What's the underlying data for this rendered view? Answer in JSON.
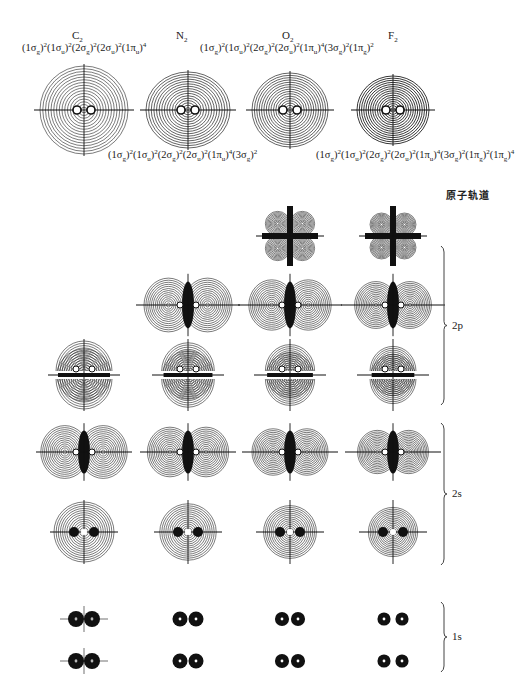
{
  "molecules": [
    {
      "name": "C",
      "sub": "2",
      "x": 72,
      "y": 34
    },
    {
      "name": "N",
      "sub": "2",
      "x": 176,
      "y": 34
    },
    {
      "name": "O",
      "sub": "2",
      "x": 282,
      "y": 34
    },
    {
      "name": "F",
      "sub": "2",
      "x": 388,
      "y": 34
    }
  ],
  "configurations": [
    {
      "molecule": "C2",
      "text": "(1σg)²(1σu)²(2σg)²(2σu)²(1πu)⁴",
      "terms": [
        [
          "1σ",
          "g",
          "2"
        ],
        [
          "1σ",
          "u",
          "2"
        ],
        [
          "2σ",
          "g",
          "2"
        ],
        [
          "2σ",
          "u",
          "2"
        ],
        [
          "1π",
          "u",
          "4"
        ]
      ],
      "x": 22,
      "y": 50
    },
    {
      "molecule": "N2",
      "text": "(1σg)²(1σu)²(2σg)²(2σu)²(1πu)⁴(3σg)²",
      "terms": [
        [
          "1σ",
          "g",
          "2"
        ],
        [
          "1σ",
          "u",
          "2"
        ],
        [
          "2σ",
          "g",
          "2"
        ],
        [
          "2σ",
          "u",
          "2"
        ],
        [
          "1π",
          "u",
          "4"
        ],
        [
          "3σ",
          "g",
          "2"
        ]
      ],
      "x": 108,
      "y": 157
    },
    {
      "molecule": "O2",
      "text": "(1σg)²(1σu)²(2σg)²(2σu)²(1πu)⁴(3σg)²(1πg)²",
      "terms": [
        [
          "1σ",
          "g",
          "2"
        ],
        [
          "1σ",
          "u",
          "2"
        ],
        [
          "2σ",
          "g",
          "2"
        ],
        [
          "2σ",
          "u",
          "2"
        ],
        [
          "1π",
          "u",
          "4"
        ],
        [
          "3σ",
          "g",
          "2"
        ],
        [
          "1π",
          "g",
          "2"
        ]
      ],
      "x": 200,
      "y": 50
    },
    {
      "molecule": "F2",
      "text": "(1σg)²(1σu)²(2σg)²(2σu)²(1πu)⁴(3σg)²(1πg)²(1πg)⁴",
      "terms": [
        [
          "1σ",
          "g",
          "2"
        ],
        [
          "1σ",
          "u",
          "2"
        ],
        [
          "2σ",
          "g",
          "2"
        ],
        [
          "2σ",
          "u",
          "2"
        ],
        [
          "1π",
          "u",
          "4"
        ],
        [
          "3σ",
          "g",
          "2"
        ],
        [
          "1π",
          "g",
          "2"
        ],
        [
          "1π",
          "g",
          "4"
        ]
      ],
      "x": 316,
      "y": 157
    }
  ],
  "atomic_orbital_heading": "原子轨道",
  "groups": [
    {
      "label": "2p",
      "y_top": 246,
      "y_bottom": 405
    },
    {
      "label": "2s",
      "y_top": 423,
      "y_bottom": 565
    },
    {
      "label": "1s",
      "y_top": 602,
      "y_bottom": 672
    }
  ],
  "columns_x": [
    84,
    188,
    290,
    393
  ],
  "total_density": {
    "y": 110,
    "shapes": [
      {
        "col": 0,
        "rx": 44,
        "ry": 44,
        "tone": "light"
      },
      {
        "col": 1,
        "rx": 42,
        "ry": 38,
        "tone": "mid"
      },
      {
        "col": 2,
        "rx": 38,
        "ry": 37,
        "tone": "mid"
      },
      {
        "col": 3,
        "rx": 36,
        "ry": 34,
        "tone": "dark"
      }
    ]
  },
  "orbital_rows": [
    {
      "y": 236,
      "type": "clover",
      "cols": [
        2,
        3
      ]
    },
    {
      "y": 305,
      "type": "pi_vertical",
      "cols": [
        1,
        2,
        3
      ]
    },
    {
      "y": 375,
      "type": "split_h",
      "cols": [
        0,
        1,
        2,
        3
      ]
    },
    {
      "y": 452,
      "type": "pi_vertical",
      "cols": [
        0,
        1,
        2,
        3
      ]
    },
    {
      "y": 532,
      "type": "sigma",
      "cols": [
        0,
        1,
        2,
        3
      ]
    },
    {
      "y": 619,
      "type": "core",
      "cols": [
        0,
        1,
        2,
        3
      ]
    },
    {
      "y": 661,
      "type": "core",
      "cols": [
        0,
        1,
        2,
        3
      ]
    }
  ]
}
